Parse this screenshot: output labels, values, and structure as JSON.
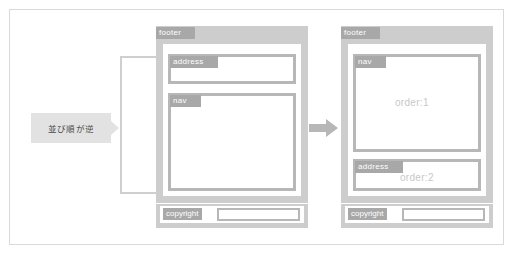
{
  "figure": {
    "note": {
      "text": "並び順が逆",
      "tail_icon": "triangle-right-icon"
    },
    "transition_arrow_icon": "arrow-right-icon",
    "bracket_icon": "grouping-bracket"
  },
  "before_panel": {
    "container_tag": "footer",
    "boxes": [
      {
        "tag": "address",
        "order_text": ""
      },
      {
        "tag": "nav",
        "order_text": ""
      }
    ],
    "copyright": {
      "tag": "copyright",
      "value": ""
    }
  },
  "after_panel": {
    "container_tag": "footer",
    "boxes": [
      {
        "tag": "nav",
        "order_text": "order:1"
      },
      {
        "tag": "address",
        "order_text": "order:2"
      }
    ],
    "copyright": {
      "tag": "copyright",
      "value": ""
    }
  },
  "colors": {
    "frame_border": "#d9d9d9",
    "container_fill": "#cdcdcd",
    "box_border": "#b7b7b7",
    "tag_fill": "#a8a8a8",
    "tag_text": "#ffffff",
    "note_fill": "#e2e2e2",
    "note_text": "#4a4a4a",
    "order_text": "#c8c8c8",
    "bracket_border": "#cfcfcf",
    "arrow_fill": "#b7b7b7",
    "page_background": "#ffffff"
  }
}
